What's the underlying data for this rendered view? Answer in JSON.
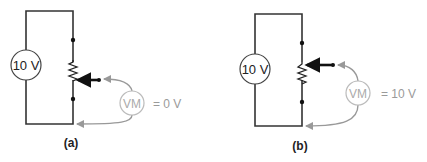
{
  "figure": {
    "panels": [
      {
        "id": "a",
        "caption": "(a)",
        "source_label": "10 V",
        "meter_label": "VM",
        "meter_reading": "= 0 V",
        "wiper_position": "bottom"
      },
      {
        "id": "b",
        "caption": "(b)",
        "source_label": "10 V",
        "meter_label": "VM",
        "meter_reading": "= 10 V",
        "wiper_position": "top"
      }
    ],
    "colors": {
      "wire": "#333333",
      "meter": "#aaaaaa",
      "lead": "#999999"
    }
  }
}
